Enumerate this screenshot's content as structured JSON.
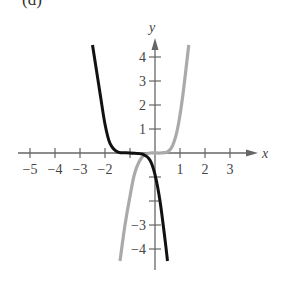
{
  "panel_label": "(d)",
  "chart_data": {
    "type": "line",
    "title": "(d)",
    "xlabel": "x",
    "ylabel": "y",
    "xlim": [
      -5.5,
      4
    ],
    "ylim": [
      -4.5,
      4.7
    ],
    "grid": false,
    "legend": null,
    "x_ticks": [
      -5,
      -4,
      -3,
      -2,
      -1,
      1,
      2,
      3
    ],
    "x_tick_labels": [
      "-5",
      "-4",
      "-3",
      "-2",
      "1",
      "2",
      "3"
    ],
    "y_ticks": [
      4,
      3,
      2,
      1,
      -1,
      -2,
      -3,
      -4
    ],
    "y_tick_labels": [
      "4",
      "3",
      "2",
      "1",
      "-3",
      "-4"
    ],
    "series": [
      {
        "name": "black curve",
        "color": "#111111",
        "description": "decreasing odd-degree curve, flat near y=0 for x in about [-1.6, -0.2]",
        "x": [
          -2.5,
          -2.2,
          -2.0,
          -1.8,
          -1.5,
          -1.0,
          -0.5,
          -0.2,
          0.0,
          0.2,
          0.4,
          0.5
        ],
        "y": [
          4.5,
          2.5,
          1.2,
          0.4,
          0.05,
          0.0,
          -0.05,
          -0.3,
          -0.9,
          -2.0,
          -3.6,
          -4.5
        ]
      },
      {
        "name": "gray curve",
        "color": "#aaaaaa",
        "description": "increasing odd-degree curve, flat near y=0 for x in about [-0.2, 0.6]",
        "x": [
          -1.4,
          -1.2,
          -1.0,
          -0.8,
          -0.5,
          -0.2,
          0.2,
          0.5,
          0.7,
          0.9,
          1.1,
          1.35
        ],
        "y": [
          -4.5,
          -3.0,
          -1.8,
          -0.8,
          -0.15,
          0.0,
          0.0,
          0.05,
          0.3,
          1.0,
          2.3,
          4.5
        ]
      }
    ]
  }
}
